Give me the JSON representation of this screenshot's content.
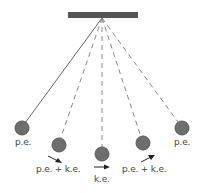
{
  "diagram": {
    "colors": {
      "support": "#555555",
      "bob": "#6e6e6e",
      "bob_stroke": "#5a5a5a",
      "string": "#777777",
      "text": "#444444"
    },
    "labels": {
      "left_extreme": "p.e.",
      "left_mid": "p.e. + k.e.",
      "bottom": "k.e.",
      "right_mid": "p.e. + k.e.",
      "right_extreme": "p.e."
    },
    "positions": [
      {
        "name": "left-extreme",
        "string": "solid",
        "energy": "p.e."
      },
      {
        "name": "left-mid",
        "string": "dashed",
        "energy": "p.e. + k.e."
      },
      {
        "name": "bottom",
        "string": "dashed",
        "energy": "k.e."
      },
      {
        "name": "right-mid",
        "string": "dashed",
        "energy": "p.e. + k.e."
      },
      {
        "name": "right-extreme",
        "string": "dashed",
        "energy": "p.e."
      }
    ]
  }
}
